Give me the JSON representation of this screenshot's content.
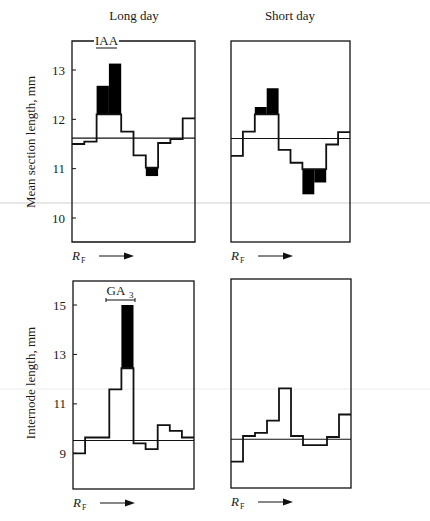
{
  "chart_data": [
    {
      "id": "long-day-iaa",
      "type": "step",
      "column_title": "Long day",
      "ylabel": "Mean section length, mm",
      "xlabel": "R_F",
      "xlabel_main": "R",
      "xlabel_sub": "F",
      "annotation": "IAA",
      "annotation_style": "underlined-on-border",
      "yticks": [
        10,
        11,
        12,
        13
      ],
      "ylim": [
        9.55,
        13.6
      ],
      "reference_line": 11.62,
      "segments": 10,
      "values": [
        11.5,
        11.55,
        12.1,
        12.1,
        11.75,
        11.27,
        11.02,
        11.52,
        11.6,
        12.02
      ],
      "shaded": [
        null,
        null,
        12.68,
        13.13,
        null,
        null,
        10.85,
        null,
        null,
        null
      ]
    },
    {
      "id": "short-day-iaa",
      "type": "step",
      "column_title": "Short day",
      "ylabel": "",
      "xlabel": "R_F",
      "xlabel_main": "R",
      "xlabel_sub": "F",
      "annotation": "",
      "yticks": [],
      "ylim": [
        9.55,
        13.6
      ],
      "reference_line": 11.61,
      "segments": 10,
      "values": [
        11.26,
        11.75,
        12.1,
        12.1,
        11.38,
        11.12,
        10.99,
        10.99,
        11.49,
        11.74
      ],
      "shaded": [
        null,
        null,
        12.25,
        12.63,
        null,
        null,
        10.48,
        10.72,
        null,
        null
      ]
    },
    {
      "id": "long-day-ga3",
      "type": "step",
      "column_title": "",
      "ylabel": "Internode length, mm",
      "xlabel": "R_F",
      "xlabel_main": "R",
      "xlabel_sub": "F",
      "annotation": "GA3",
      "annotation_main": "GA",
      "annotation_sub": "3",
      "annotation_style": "bracket",
      "yticks": [
        9,
        11,
        13,
        15
      ],
      "ylim": [
        7.5,
        16.0
      ],
      "reference_line": 9.52,
      "segments": 10,
      "values": [
        9.0,
        9.64,
        9.64,
        11.59,
        12.44,
        9.4,
        9.17,
        10.14,
        9.91,
        9.64
      ],
      "shaded": [
        null,
        null,
        null,
        null,
        15.0,
        null,
        null,
        null,
        null,
        null
      ]
    },
    {
      "id": "short-day-ga3",
      "type": "step",
      "column_title": "",
      "ylabel": "",
      "xlabel": "R_F",
      "xlabel_main": "R",
      "xlabel_sub": "F",
      "annotation": "",
      "yticks": [],
      "ylim": [
        7.5,
        16.0
      ],
      "reference_line": 9.57,
      "segments": 10,
      "values": [
        8.66,
        9.7,
        9.83,
        10.32,
        11.63,
        9.7,
        9.33,
        9.33,
        9.66,
        10.57
      ],
      "shaded": [
        null,
        null,
        null,
        null,
        null,
        null,
        null,
        null,
        null,
        null
      ]
    }
  ],
  "columns": {
    "left_title": "Long day",
    "right_title": "Short day"
  },
  "colors": {
    "ink": "#111111",
    "shade": "#000000",
    "scan_line": "#c8c8c8"
  }
}
